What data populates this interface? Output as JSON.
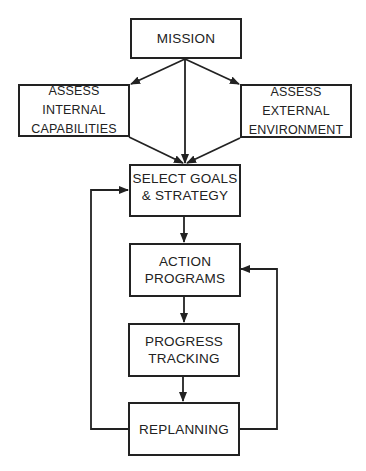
{
  "diagram": {
    "type": "flowchart",
    "nodes": {
      "mission": {
        "lines": [
          "MISSION"
        ]
      },
      "internal": {
        "lines": [
          "ASSESS",
          "INTERNAL",
          "CAPABILITIES"
        ]
      },
      "external": {
        "lines": [
          "ASSESS",
          "EXTERNAL",
          "ENVIRONMENT"
        ]
      },
      "select": {
        "lines": [
          "SELECT GOALS",
          "& STRATEGY"
        ]
      },
      "action": {
        "lines": [
          "ACTION",
          "PROGRAMS"
        ]
      },
      "progress": {
        "lines": [
          "PROGRESS",
          "TRACKING"
        ]
      },
      "replanning": {
        "lines": [
          "REPLANNING"
        ]
      }
    },
    "edges": [
      {
        "from": "MISSION",
        "to": "ASSESS INTERNAL CAPABILITIES"
      },
      {
        "from": "MISSION",
        "to": "ASSESS EXTERNAL ENVIRONMENT"
      },
      {
        "from": "MISSION",
        "to": "SELECT GOALS & STRATEGY"
      },
      {
        "from": "ASSESS INTERNAL CAPABILITIES",
        "to": "SELECT GOALS & STRATEGY"
      },
      {
        "from": "ASSESS EXTERNAL ENVIRONMENT",
        "to": "SELECT GOALS & STRATEGY"
      },
      {
        "from": "SELECT GOALS & STRATEGY",
        "to": "ACTION PROGRAMS"
      },
      {
        "from": "ACTION PROGRAMS",
        "to": "PROGRESS TRACKING"
      },
      {
        "from": "PROGRESS TRACKING",
        "to": "REPLANNING"
      },
      {
        "from": "REPLANNING",
        "to": "SELECT GOALS & STRATEGY",
        "route": "left-loop"
      },
      {
        "from": "REPLANNING",
        "to": "ACTION PROGRAMS",
        "route": "right-loop"
      }
    ],
    "colors": {
      "stroke": "#222222",
      "background": "#ffffff",
      "text": "#222222"
    }
  }
}
